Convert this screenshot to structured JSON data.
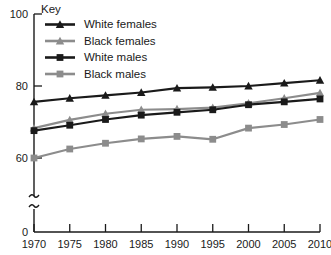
{
  "chart_data": {
    "type": "line",
    "title": "",
    "subtitle": "",
    "xlabel": "",
    "ylabel": "",
    "grid": false,
    "legend_position": "top-left",
    "legend_title": "Key",
    "x": [
      1970,
      1975,
      1980,
      1985,
      1990,
      1995,
      2000,
      2005,
      2010
    ],
    "xlim": [
      1970,
      2010
    ],
    "ylim": [
      60,
      100
    ],
    "y_axis_break": true,
    "y_ticks": [
      0,
      60,
      80,
      100
    ],
    "x_ticks": [
      "1970",
      "1975",
      "1980",
      "1985",
      "1990",
      "1995",
      "2000",
      "2005",
      "2010"
    ],
    "series": [
      {
        "name": "White females",
        "color": "#1a1a1a",
        "marker": "triangle",
        "values": [
          75.6,
          76.6,
          77.4,
          78.2,
          79.4,
          79.6,
          80.0,
          80.8,
          81.6
        ]
      },
      {
        "name": "Black females",
        "color": "#8c8c8c",
        "marker": "triangle",
        "values": [
          68.3,
          70.6,
          72.3,
          73.4,
          73.6,
          74.0,
          75.2,
          76.6,
          78.1
        ]
      },
      {
        "name": "White males",
        "color": "#1a1a1a",
        "marker": "square",
        "values": [
          67.6,
          69.1,
          70.7,
          71.9,
          72.7,
          73.4,
          74.8,
          75.6,
          76.4
        ]
      },
      {
        "name": "Black males",
        "color": "#8c8c8c",
        "marker": "square",
        "values": [
          60.0,
          62.5,
          64.1,
          65.3,
          66.0,
          65.2,
          68.3,
          69.3,
          70.7
        ]
      }
    ]
  },
  "legend": {
    "title": "Key",
    "entries": [
      {
        "label": "White females",
        "color": "#1a1a1a",
        "marker": "triangle"
      },
      {
        "label": "Black females",
        "color": "#8c8c8c",
        "marker": "triangle"
      },
      {
        "label": "White males",
        "color": "#1a1a1a",
        "marker": "square"
      },
      {
        "label": "Black males",
        "color": "#8c8c8c",
        "marker": "square"
      }
    ]
  },
  "axes": {
    "y_tick_labels": [
      "100",
      "80",
      "60",
      "0"
    ],
    "x_tick_labels": [
      "1970",
      "1975",
      "1980",
      "1985",
      "1990",
      "1995",
      "2000",
      "2005",
      "2010"
    ]
  },
  "colors": {
    "black_series": "#1a1a1a",
    "gray_series": "#8c8c8c",
    "axis": "#1a1a1a",
    "background": "#ffffff"
  }
}
